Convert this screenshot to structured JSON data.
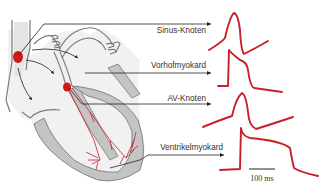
{
  "labels": [
    {
      "id": "sinus",
      "text": "Sinus-Knoten"
    },
    {
      "id": "atrial",
      "text": "Vorhofmyokard"
    },
    {
      "id": "av",
      "text": "AV-Knoten"
    },
    {
      "id": "ventricular",
      "text": "Ventrikelmyokard"
    }
  ],
  "scale_bar": {
    "label": "100 ms"
  },
  "colors": {
    "node": "#d01818",
    "trace": "#c8202a",
    "tissue": "#c4c4c4",
    "outline": "#7a7a7a",
    "interior": "#f1f1f1",
    "leader": "#222222"
  }
}
